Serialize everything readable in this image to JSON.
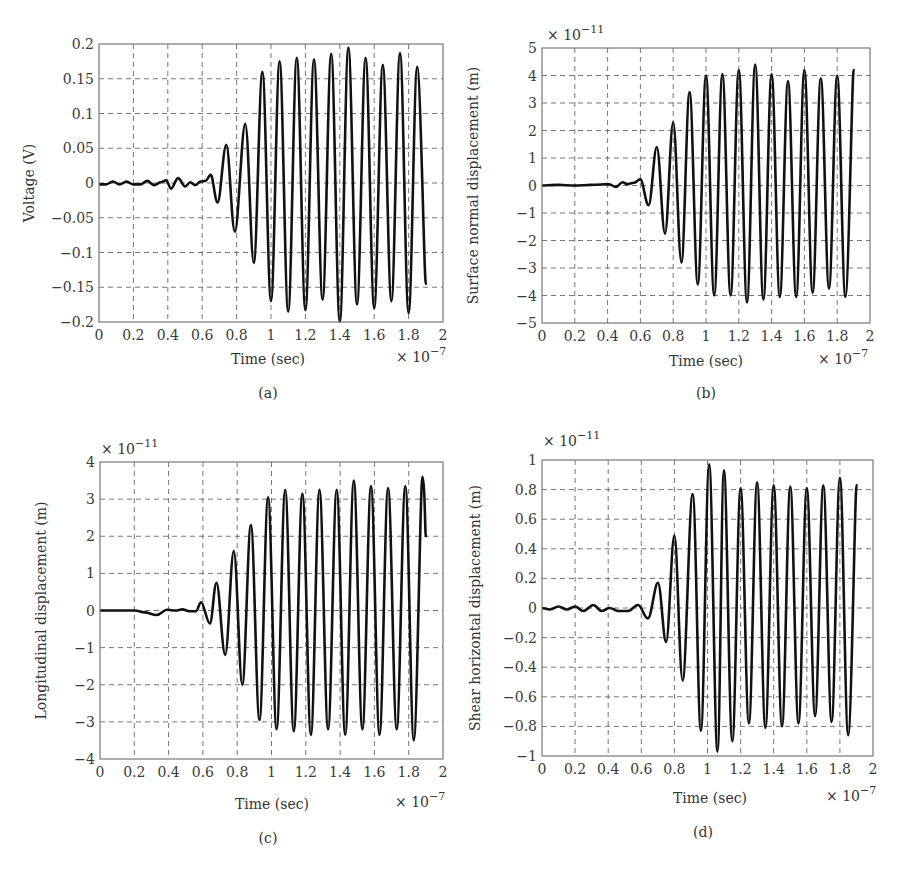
{
  "figure": {
    "panels": [
      {
        "id": "a",
        "caption": "(a)",
        "ylabel": "Voltage (V)",
        "xlabel": "Time (sec)",
        "x_multiplier": "× 10",
        "x_exponent": "−7",
        "y_multiplier": "",
        "y_exponent": "",
        "box": [
          99,
          44,
          443,
          322
        ],
        "caption_pos": [
          268,
          398
        ],
        "ylabel_x": 34,
        "xlabel_pos": [
          268,
          364
        ],
        "xmult_pos": [
          396,
          362
        ],
        "ymult_pos": null
      },
      {
        "id": "b",
        "caption": "(b)",
        "ylabel": "Surface normal displacement (m)",
        "xlabel": "Time (sec)",
        "x_multiplier": "× 10",
        "x_exponent": "−7",
        "y_multiplier": "× 10",
        "y_exponent": "−11",
        "box": [
          542,
          48,
          870,
          323
        ],
        "caption_pos": [
          706,
          398
        ],
        "ylabel_x": 478,
        "xlabel_pos": [
          706,
          366
        ],
        "xmult_pos": [
          818,
          364
        ],
        "ymult_pos": [
          547,
          40
        ]
      },
      {
        "id": "c",
        "caption": "(c)",
        "ylabel": "Longitudinal displacement (m)",
        "xlabel": "Time (sec)",
        "x_multiplier": "× 10",
        "x_exponent": "−7",
        "y_multiplier": "× 10",
        "y_exponent": "−11",
        "box": [
          100,
          462,
          443,
          759
        ],
        "caption_pos": [
          268,
          843
        ],
        "ylabel_x": 46,
        "xlabel_pos": [
          272,
          809
        ],
        "xmult_pos": [
          395,
          807
        ],
        "ymult_pos": [
          101,
          454
        ]
      },
      {
        "id": "d",
        "caption": "(d)",
        "ylabel": "Shear horizontal displacement (m)",
        "xlabel": "Time (sec)",
        "x_multiplier": "× 10",
        "x_exponent": "−7",
        "y_multiplier": "× 10",
        "y_exponent": "−11",
        "box": [
          542,
          460,
          873,
          756
        ],
        "caption_pos": [
          703,
          837
        ],
        "ylabel_x": 480,
        "xlabel_pos": [
          710,
          803
        ],
        "xmult_pos": [
          826,
          801
        ],
        "ymult_pos": [
          543,
          446
        ]
      }
    ]
  },
  "chart_data": [
    {
      "type": "line",
      "title": "(a)",
      "xlabel": "Time (sec)",
      "ylabel": "Voltage (V)",
      "x_scale_note": "× 10^-7",
      "xlim": [
        0,
        2
      ],
      "ylim": [
        -0.2,
        0.2
      ],
      "xticks": [
        "0",
        "0.2",
        "0.4",
        "0.6",
        "0.8",
        "1",
        "1.2",
        "1.4",
        "1.6",
        "1.8",
        "2"
      ],
      "yticks": [
        "−0.2",
        "−0.15",
        "−0.1",
        "−0.05",
        "0",
        "0.05",
        "0.1",
        "0.15",
        "0.2"
      ],
      "ytick_values": [
        -0.2,
        -0.15,
        -0.1,
        -0.05,
        0,
        0.05,
        0.1,
        0.15,
        0.2
      ],
      "grid": true,
      "series": [
        {
          "name": "Voltage",
          "x": [
            0,
            0.04,
            0.08,
            0.12,
            0.16,
            0.2,
            0.24,
            0.28,
            0.32,
            0.36,
            0.39,
            0.42,
            0.46,
            0.5,
            0.53,
            0.56,
            0.59,
            0.62,
            0.65,
            0.69,
            0.74,
            0.79,
            0.85,
            0.9,
            0.95,
            1.0,
            1.05,
            1.1,
            1.15,
            1.2,
            1.25,
            1.3,
            1.35,
            1.4,
            1.45,
            1.5,
            1.55,
            1.6,
            1.65,
            1.7,
            1.75,
            1.8,
            1.85,
            1.9
          ],
          "y": [
            -0.002,
            -0.002,
            0.002,
            -0.002,
            0.002,
            -0.002,
            -0.002,
            0.003,
            -0.003,
            0.001,
            0.004,
            -0.008,
            0.007,
            -0.005,
            0.001,
            -0.003,
            0.002,
            0.003,
            0.012,
            -0.028,
            0.055,
            -0.07,
            0.085,
            -0.115,
            0.16,
            -0.17,
            0.175,
            -0.185,
            0.18,
            -0.183,
            0.178,
            -0.168,
            0.186,
            -0.2,
            0.195,
            -0.175,
            0.18,
            -0.18,
            0.17,
            -0.17,
            0.187,
            -0.187,
            0.167,
            -0.145
          ]
        }
      ]
    },
    {
      "type": "line",
      "title": "(b)",
      "xlabel": "Time (sec)",
      "ylabel": "Surface normal displacement (m)",
      "x_scale_note": "× 10^-7",
      "y_scale_note": "× 10^-11",
      "xlim": [
        0,
        2
      ],
      "ylim": [
        -5,
        5
      ],
      "xticks": [
        "0",
        "0.2",
        "0.4",
        "0.6",
        "0.8",
        "1",
        "1.2",
        "1.4",
        "1.6",
        "1.8",
        "2"
      ],
      "yticks": [
        "−5",
        "−4",
        "−3",
        "−2",
        "−1",
        "0",
        "1",
        "2",
        "3",
        "4",
        "5"
      ],
      "ytick_values": [
        -5,
        -4,
        -3,
        -2,
        -1,
        0,
        1,
        2,
        3,
        4,
        5
      ],
      "grid": true,
      "series": [
        {
          "name": "Surface normal displacement",
          "x": [
            0,
            0.1,
            0.2,
            0.3,
            0.4,
            0.45,
            0.49,
            0.52,
            0.56,
            0.6,
            0.65,
            0.7,
            0.75,
            0.8,
            0.85,
            0.9,
            0.95,
            1.0,
            1.05,
            1.1,
            1.15,
            1.2,
            1.25,
            1.3,
            1.35,
            1.4,
            1.45,
            1.5,
            1.55,
            1.6,
            1.65,
            1.7,
            1.75,
            1.8,
            1.85,
            1.9
          ],
          "y": [
            0,
            0.02,
            0,
            0.02,
            0.05,
            -0.05,
            0.12,
            0.05,
            0.1,
            0.22,
            -0.72,
            1.4,
            -1.75,
            2.3,
            -2.8,
            3.4,
            -3.6,
            4.0,
            -4.0,
            4.05,
            -4.0,
            4.2,
            -4.25,
            4.4,
            -4.15,
            4.05,
            -4.05,
            3.8,
            -4.05,
            4.2,
            -3.9,
            3.9,
            -3.75,
            4.0,
            -4.05,
            4.2
          ]
        }
      ]
    },
    {
      "type": "line",
      "title": "(c)",
      "xlabel": "Time (sec)",
      "ylabel": "Longitudinal displacement (m)",
      "x_scale_note": "× 10^-7",
      "y_scale_note": "× 10^-11",
      "xlim": [
        0,
        2
      ],
      "ylim": [
        -4,
        4
      ],
      "xticks": [
        "0",
        "0.2",
        "0.4",
        "0.6",
        "0.8",
        "1",
        "1.2",
        "1.4",
        "1.6",
        "1.8",
        "2"
      ],
      "yticks": [
        "−4",
        "−3",
        "−2",
        "−1",
        "0",
        "1",
        "2",
        "3",
        "4"
      ],
      "ytick_values": [
        -4,
        -3,
        -2,
        -1,
        0,
        1,
        2,
        3,
        4
      ],
      "grid": true,
      "series": [
        {
          "name": "Longitudinal displacement",
          "x": [
            0,
            0.1,
            0.2,
            0.26,
            0.33,
            0.39,
            0.44,
            0.48,
            0.52,
            0.56,
            0.59,
            0.64,
            0.68,
            0.73,
            0.78,
            0.83,
            0.88,
            0.93,
            0.98,
            1.03,
            1.08,
            1.13,
            1.18,
            1.23,
            1.28,
            1.33,
            1.38,
            1.43,
            1.48,
            1.53,
            1.58,
            1.63,
            1.68,
            1.73,
            1.78,
            1.83,
            1.88,
            1.9
          ],
          "y": [
            0,
            0,
            0,
            -0.05,
            -0.12,
            0.02,
            0,
            0.03,
            -0.02,
            -0.02,
            0.22,
            -0.35,
            0.75,
            -1.2,
            1.6,
            -2.0,
            2.3,
            -2.95,
            3.05,
            -3.2,
            3.25,
            -3.25,
            3.15,
            -3.35,
            3.25,
            -3.2,
            3.25,
            -3.35,
            3.5,
            -3.2,
            3.35,
            -3.35,
            3.3,
            -3.2,
            3.35,
            -3.5,
            3.6,
            2.0
          ]
        }
      ]
    },
    {
      "type": "line",
      "title": "(d)",
      "xlabel": "Time (sec)",
      "ylabel": "Shear horizontal displacement (m)",
      "x_scale_note": "× 10^-7",
      "y_scale_note": "× 10^-11",
      "xlim": [
        0,
        2
      ],
      "ylim": [
        -1,
        1
      ],
      "xticks": [
        "0",
        "0.2",
        "0.4",
        "0.6",
        "0.8",
        "1",
        "1.2",
        "1.4",
        "1.6",
        "1.8",
        "2"
      ],
      "yticks": [
        "−1",
        "−0.8",
        "−0.6",
        "−0.4",
        "−0.2",
        "0",
        "0.2",
        "0.4",
        "0.6",
        "0.8",
        "1"
      ],
      "ytick_values": [
        -1,
        -0.8,
        -0.6,
        -0.4,
        -0.2,
        0,
        0.2,
        0.4,
        0.6,
        0.8,
        1
      ],
      "grid": true,
      "series": [
        {
          "name": "Shear horizontal displacement",
          "x": [
            0,
            0.05,
            0.1,
            0.15,
            0.2,
            0.25,
            0.31,
            0.36,
            0.41,
            0.46,
            0.52,
            0.58,
            0.64,
            0.7,
            0.75,
            0.8,
            0.85,
            0.91,
            0.96,
            1.01,
            1.06,
            1.1,
            1.15,
            1.2,
            1.25,
            1.3,
            1.35,
            1.4,
            1.45,
            1.5,
            1.55,
            1.6,
            1.65,
            1.7,
            1.75,
            1.8,
            1.85,
            1.9
          ],
          "y": [
            0,
            -0.01,
            0.01,
            -0.01,
            0.01,
            -0.02,
            0.02,
            -0.02,
            0,
            -0.02,
            -0.02,
            0.02,
            -0.07,
            0.17,
            -0.23,
            0.49,
            -0.49,
            0.77,
            -0.83,
            0.97,
            -0.97,
            0.93,
            -0.9,
            0.81,
            -0.78,
            0.85,
            -0.81,
            0.83,
            -0.8,
            0.82,
            -0.78,
            0.81,
            -0.73,
            0.83,
            -0.77,
            0.88,
            -0.86,
            0.83
          ]
        }
      ]
    }
  ]
}
